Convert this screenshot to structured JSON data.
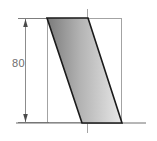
{
  "drawing": {
    "title": "technical-section-drawing",
    "width": 157,
    "height": 141,
    "background_color": "#ffffff",
    "dimensions": [
      {
        "id": "height-dimension",
        "label": "80",
        "label_x": 16,
        "label_y": 64,
        "orientation": "vertical",
        "line_x": 25,
        "line_y_top": 18,
        "line_y_bottom": 123,
        "color": "#6e6e6e",
        "arrow_style": "filled-solid",
        "extension_line_start_x": 18,
        "extension_line_end_x": 49
      }
    ],
    "shape": {
      "id": "slanted-parallelogram",
      "type": "parallelogram",
      "points": "47,18 88,18 122,123 82,123",
      "fill_start_color": "#7b7b7b",
      "fill_end_color": "#e8e8e8",
      "stroke_color": "#1a1a1a",
      "stroke_width": 1.6
    },
    "construction_box": {
      "id": "bounding-construction-box",
      "x": 47,
      "y": 18,
      "width": 75,
      "height": 105,
      "stroke_color": "#9a9a9a",
      "stroke_width": 0.9
    },
    "center_line": {
      "id": "vertical-center-line",
      "x": 87,
      "y_top": 9,
      "y_bottom": 134,
      "stroke_color": "#9a9a9a",
      "stroke_width": 0.9,
      "dash_pattern": "14,3,2,3"
    },
    "base_line": {
      "id": "horizontal-base-line",
      "x_start": 16,
      "x_end": 146,
      "y": 123,
      "stroke_color": "#6e6e6e",
      "stroke_width": 1.0
    }
  }
}
